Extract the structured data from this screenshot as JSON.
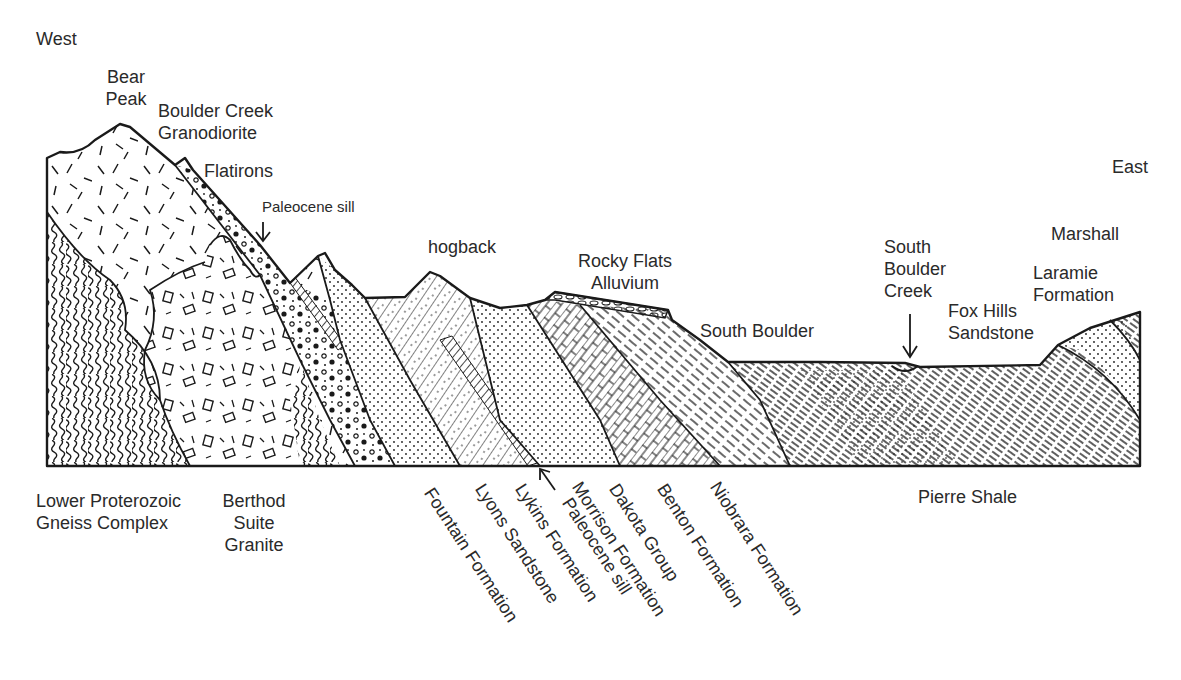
{
  "diagram": {
    "directions": {
      "west": "West",
      "east": "East"
    },
    "surface_labels": {
      "bear_peak": [
        "Bear",
        "Peak"
      ],
      "boulder_creek_granodiorite": [
        "Boulder Creek",
        "Granodiorite"
      ],
      "flatirons": "Flatirons",
      "paleocene_sill_top": "Paleocene sill",
      "hogback": "hogback",
      "rocky_flats_alluvium": [
        "Rocky Flats",
        "Alluvium"
      ],
      "south_boulder": "South Boulder",
      "south_boulder_creek": [
        "South",
        "Boulder",
        "Creek"
      ],
      "fox_hills_sandstone": [
        "Fox Hills",
        "Sandstone"
      ],
      "marshall": "Marshall",
      "laramie_formation": [
        "Laramie",
        "Formation"
      ]
    },
    "bottom_labels": {
      "gneiss_complex": [
        "Lower Proterozoic",
        "Gneiss Complex"
      ],
      "berthod_granite": [
        "Berthod",
        "Suite",
        "Granite"
      ],
      "pierre_shale": "Pierre Shale"
    },
    "rotated_labels": [
      "Fountain Formation",
      "Lyons Sandstone",
      "Lykins Formation",
      "Paleocene sill",
      "Morrison Formation",
      "Dakota Group",
      "Benton Formation",
      "Niobrara Formation"
    ],
    "colors": {
      "ink": "#1a1a1a",
      "background": "#ffffff",
      "text": "#2a2a2a"
    }
  }
}
